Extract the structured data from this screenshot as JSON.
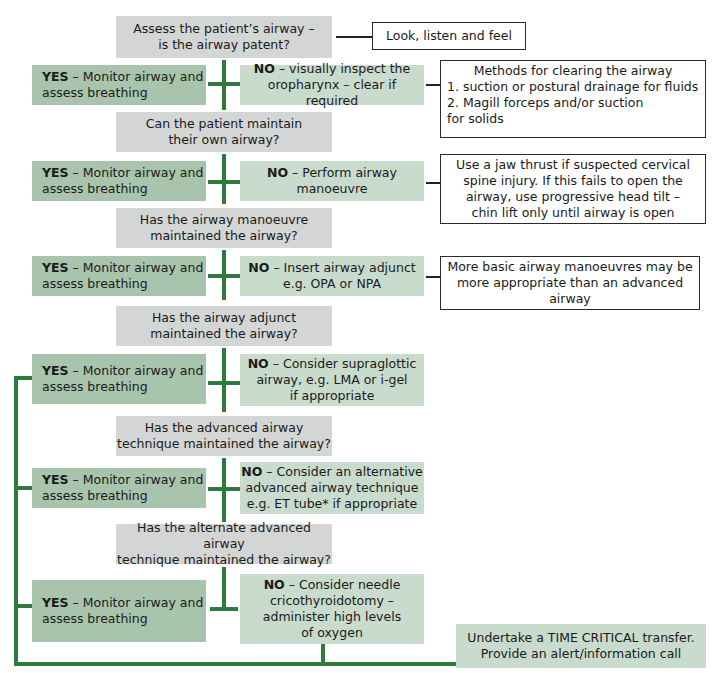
{
  "colors": {
    "question_box": "#d3d6d4",
    "yes_box": "#a8c4ad",
    "no_box": "#c9dbcc",
    "connector_green": "#2e7a3a",
    "note_border": "#2a2a2a"
  },
  "steps": [
    {
      "question": "Assess the patient’s airway –\nis the airway patent?",
      "note": "Look, listen and feel"
    },
    {
      "yes_prefix": "YES",
      "yes_text": " – Monitor airway and\nassess breathing",
      "no_prefix": "NO",
      "no_text": " – visually inspect the\noropharynx – clear if required",
      "note_title": "Methods for clearing the airway",
      "note_items": [
        "1.  suction or postural drainage for fluids",
        "2.  Magill forceps and/or suction\n      for solids"
      ]
    },
    {
      "question": "Can the patient maintain\ntheir own airway?"
    },
    {
      "yes_prefix": "YES",
      "yes_text": " – Monitor airway and\nassess breathing",
      "no_prefix": "NO",
      "no_text": " – Perform airway\nmanoeuvre",
      "note": "Use a jaw thrust if suspected cervical\nspine injury. If this fails to open the\nairway, use progressive head tilt –\nchin lift only until airway is open"
    },
    {
      "question": "Has the airway manoeuvre\nmaintained the airway?"
    },
    {
      "yes_prefix": "YES",
      "yes_text": " – Monitor airway and\nassess breathing",
      "no_prefix": "NO",
      "no_text": " – Insert airway adjunct\ne.g. OPA or NPA",
      "note": "More basic airway manoeuvres may be\nmore appropriate than an advanced\nairway"
    },
    {
      "question": "Has the airway adjunct\nmaintained the airway?"
    },
    {
      "yes_prefix": "YES",
      "yes_text": " – Monitor airway and\nassess breathing",
      "no_prefix": "NO",
      "no_text": " – Consider supraglottic\nairway, e.g. LMA or i-gel\nif appropriate"
    },
    {
      "question": "Has the advanced airway\ntechnique maintained the airway?"
    },
    {
      "yes_prefix": "YES",
      "yes_text": " – Monitor airway and\nassess breathing",
      "no_prefix": "NO",
      "no_text": " – Consider an alternative\nadvanced airway technique\ne.g. ET tube* if appropriate"
    },
    {
      "question": "Has the alternate advanced airway\ntechnique maintained the airway?"
    },
    {
      "yes_prefix": "YES",
      "yes_text": " – Monitor airway and\nassess breathing",
      "no_prefix": "NO",
      "no_text": " – Consider needle\ncricothyroidotomy –\nadminister high levels\nof oxygen"
    }
  ],
  "final": "Undertake a TIME CRITICAL transfer.\nProvide an alert/information call"
}
